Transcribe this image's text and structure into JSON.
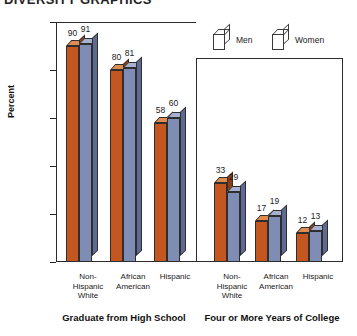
{
  "chart_title": "DIVERSITY GRAPHICS",
  "chart_data": {
    "type": "bar",
    "title": "DIVERSITY GRAPHICS",
    "xlabel": "",
    "ylabel": "Percent",
    "ylim": [
      0,
      100
    ],
    "yticks": [
      0,
      20,
      40,
      60,
      80,
      100
    ],
    "grid": true,
    "legend_position": "top-right",
    "categories": [
      "Non-Hispanic White",
      "African American",
      "Hispanic"
    ],
    "panels": [
      {
        "caption": "Graduate from High School",
        "series": [
          {
            "name": "Men",
            "values": [
              90,
              80,
              58
            ]
          },
          {
            "name": "Women",
            "values": [
              91,
              81,
              60
            ]
          }
        ]
      },
      {
        "caption": "Four or More Years of College",
        "series": [
          {
            "name": "Men",
            "values": [
              33,
              17,
              12
            ]
          },
          {
            "name": "Women",
            "values": [
              29,
              19,
              13
            ]
          }
        ]
      }
    ],
    "series_colors": {
      "Men": "#c4571f",
      "Women": "#7f8cb4"
    },
    "series_top_colors": {
      "Men": "#e08b50",
      "Women": "#a7b1d0"
    },
    "series_side_colors": {
      "Men": "#8e3c14",
      "Women": "#5e6a93"
    }
  },
  "legend": {
    "items": [
      {
        "label": "Men",
        "color": "#c4571f"
      },
      {
        "label": "Women",
        "color": "#7f8cb4"
      }
    ]
  },
  "axis": {
    "y_label": "Percent",
    "y_ticks": [
      "100",
      "80",
      "60",
      "40",
      "20",
      "0"
    ]
  },
  "category_labels": [
    "Non-\nHispanic\nWhite",
    "African\nAmerican",
    "Hispanic"
  ],
  "panel_captions": [
    "Graduate from High School",
    "Four or More Years of College"
  ]
}
